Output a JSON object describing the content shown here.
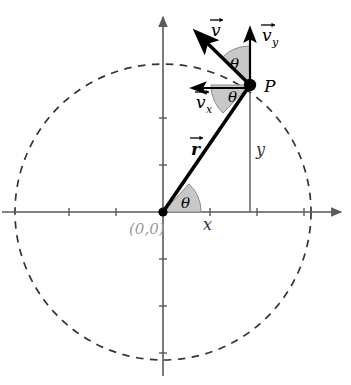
{
  "figure": {
    "background_color": "#ffffff",
    "axis_color": "#5a5a5a",
    "vector_color": "#000000",
    "wedge_fill": "#c8c8c8",
    "wedge_stroke": "#8c8c8c",
    "origin_label_color": "#999999",
    "circle_stroke": "#333333",
    "width": 351,
    "height": 385
  },
  "geometry": {
    "origin": {
      "x": 163,
      "y": 212
    },
    "point_p": {
      "x": 250,
      "y": 85
    },
    "circle_radius": 148,
    "tick_spacing": 47,
    "x_axis": {
      "start_x": 2,
      "end_x": 345,
      "y": 212
    },
    "y_axis": {
      "x": 163,
      "top_y": 12,
      "bottom_y": 376
    },
    "v_tip": {
      "x": 196,
      "y": 32
    },
    "vy_tip": {
      "x": 250,
      "y": 27
    },
    "vx_tip": {
      "x": 191,
      "y": 88
    }
  },
  "labels": {
    "origin": "(0,0)",
    "point": "P",
    "x_component": "x",
    "y_component": "y",
    "position_vector": "r",
    "velocity_vector": "v",
    "velocity_x_component": "v",
    "velocity_x_subscript": "x",
    "velocity_y_component": "v",
    "velocity_y_subscript": "y",
    "angle_at_origin": "θ",
    "angle_upper_at_p": "θ",
    "angle_lower_at_p": "θ"
  },
  "elements": {
    "circle": "dashed-circle",
    "x_axis_arrow": "arrow-right",
    "y_axis_arrow": "arrow-up",
    "point_marker": "filled-dot",
    "origin_marker": "filled-dot",
    "drop_line": "vertical-dashed-solid-line"
  }
}
